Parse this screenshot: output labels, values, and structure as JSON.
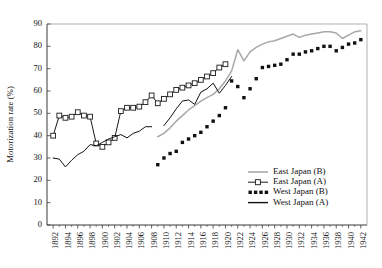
{
  "chart_data": {
    "type": "line",
    "title": "",
    "xlabel": "",
    "ylabel": "Motorization rate (%)",
    "xlim": [
      1891,
      1943
    ],
    "ylim": [
      0,
      90
    ],
    "ytick_step": 10,
    "xtick_step": 2,
    "grid": false,
    "legend_position": "bottom-right",
    "ytick_labels": [
      "0",
      "10",
      "20",
      "30",
      "40",
      "50",
      "60",
      "70",
      "80",
      "90"
    ],
    "xtick_labels": [
      "1892",
      "1894",
      "1896",
      "1898",
      "1900",
      "1902",
      "1904",
      "1906",
      "1908",
      "1910",
      "1912",
      "1914",
      "1916",
      "1918",
      "1920",
      "1922",
      "1924",
      "1926",
      "1928",
      "1930",
      "1932",
      "1934",
      "1936",
      "1938",
      "1940",
      "1942"
    ],
    "series": [
      {
        "name": "East Japan (B)",
        "style": "line-gray",
        "color": "#a8a8a8",
        "x": [
          1909,
          1910,
          1911,
          1912,
          1913,
          1914,
          1915,
          1916,
          1917,
          1918,
          1919,
          1920,
          1921,
          1922,
          1923,
          1924,
          1925,
          1926,
          1927,
          1928,
          1929,
          1930,
          1931,
          1932,
          1933,
          1934,
          1935,
          1936,
          1937,
          1938,
          1939,
          1940,
          1941,
          1942
        ],
        "values": [
          39.5,
          41.0,
          43.5,
          46.5,
          49.0,
          51.5,
          53.5,
          55.5,
          57.0,
          58.5,
          61.0,
          64.5,
          69.0,
          78.5,
          73.5,
          77.5,
          79.5,
          81.0,
          82.0,
          82.5,
          83.5,
          84.5,
          85.5,
          84.0,
          85.0,
          85.5,
          86.0,
          86.5,
          86.5,
          86.0,
          83.5,
          85.0,
          86.5,
          87.0
        ]
      },
      {
        "name": "East Japan (A)",
        "style": "line-open-square",
        "color": "#1a1a1a",
        "x": [
          1892,
          1893,
          1894,
          1895,
          1896,
          1897,
          1898,
          1899,
          1900,
          1901,
          1902,
          1903,
          1904,
          1905,
          1906,
          1907,
          1908,
          1909,
          1910,
          1911,
          1912,
          1913,
          1914,
          1915,
          1916,
          1917,
          1918,
          1919,
          1920
        ],
        "values": [
          40.0,
          49.0,
          48.0,
          48.5,
          50.5,
          49.0,
          48.5,
          36.5,
          35.0,
          37.0,
          39.0,
          51.0,
          52.5,
          52.5,
          53.0,
          55.0,
          58.0,
          54.5,
          56.5,
          58.5,
          60.5,
          61.5,
          62.5,
          63.5,
          65.0,
          66.5,
          68.0,
          70.5,
          72.0
        ]
      },
      {
        "name": "West Japan (B)",
        "style": "dotted",
        "color": "#111111",
        "x": [
          1909,
          1910,
          1911,
          1912,
          1913,
          1914,
          1915,
          1916,
          1917,
          1918,
          1919,
          1920,
          1921,
          1922,
          1923,
          1924,
          1925,
          1926,
          1927,
          1928,
          1929,
          1930,
          1931,
          1932,
          1933,
          1934,
          1935,
          1936,
          1937,
          1938,
          1939,
          1940,
          1941,
          1942
        ],
        "values": [
          27.0,
          30.0,
          32.0,
          33.0,
          37.0,
          38.5,
          40.0,
          41.5,
          44.0,
          46.5,
          49.0,
          52.5,
          64.5,
          62.0,
          57.0,
          61.0,
          65.5,
          70.5,
          71.0,
          71.5,
          72.0,
          74.0,
          76.5,
          76.5,
          77.5,
          78.0,
          79.0,
          80.0,
          80.0,
          78.0,
          79.5,
          81.0,
          81.5,
          83.0
        ]
      },
      {
        "name": "West Japan (A)",
        "style": "line-black",
        "color": "#111111",
        "x": [
          1892,
          1893,
          1894,
          1895,
          1896,
          1897,
          1898,
          1899,
          1900,
          1901,
          1902,
          1903,
          1904,
          1905,
          1906,
          1907,
          1908,
          1909,
          1910,
          1911,
          1912,
          1913,
          1914,
          1915,
          1916,
          1917,
          1918,
          1919,
          1920,
          1921
        ],
        "values": [
          30.0,
          29.5,
          26.0,
          29.0,
          31.5,
          33.0,
          36.0,
          35.5,
          37.0,
          38.5,
          39.5,
          40.5,
          39.0,
          41.0,
          42.0,
          44.0,
          44.0,
          null,
          44.5,
          48.0,
          52.0,
          55.5,
          56.0,
          54.0,
          59.5,
          61.0,
          63.5,
          59.0,
          62.5,
          66.5
        ]
      }
    ]
  },
  "legend": {
    "items": [
      {
        "label": "East Japan (B)",
        "marker": "solid-gray-line"
      },
      {
        "label": "East Japan (A)",
        "marker": "line-with-open-square"
      },
      {
        "label": "West Japan (B)",
        "marker": "dotted-squares"
      },
      {
        "label": "West Japan (A)",
        "marker": "solid-black-line"
      }
    ]
  }
}
